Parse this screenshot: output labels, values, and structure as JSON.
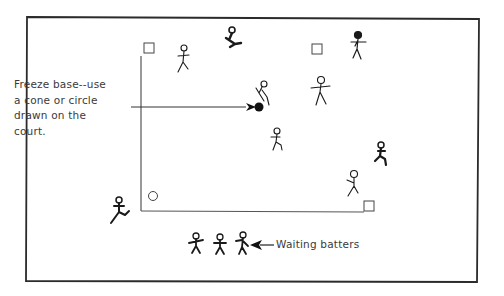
{
  "diagram": {
    "type": "game-court-layout",
    "annotations": {
      "freeze_base": {
        "lines": [
          "Freeze base--use",
          "a cone or circle",
          "drawn on the",
          "court."
        ]
      },
      "waiting_batters": "Waiting batters"
    },
    "elements": {
      "bases": [
        {
          "shape": "square",
          "position": "top-left corner of court"
        },
        {
          "shape": "square",
          "position": "top-middle"
        },
        {
          "shape": "square",
          "position": "bottom-right corner of court"
        },
        {
          "shape": "circle",
          "position": "home (bottom-left corner)"
        }
      ],
      "freeze_base_marker": {
        "shape": "filled-circle",
        "position": "center of court"
      },
      "figures": {
        "fielders_in_court": 6,
        "runners": 3,
        "batter": 1,
        "waiting_batters": 3
      }
    },
    "colors": {
      "ink": "#1a1a1a",
      "line": "#444444",
      "background": "#ffffff"
    }
  }
}
